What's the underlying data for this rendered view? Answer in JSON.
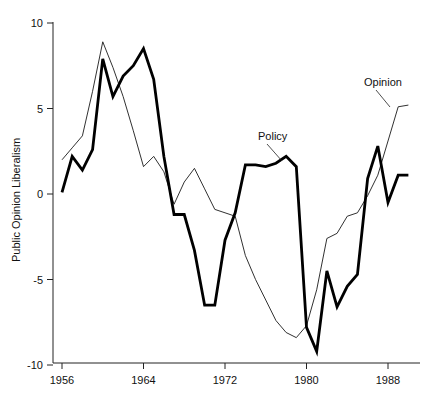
{
  "chart_data": {
    "type": "line",
    "title": "",
    "subtitle": "",
    "xlabel": "",
    "ylabel": "Public Opinion Liberalism",
    "xlim": [
      1955,
      1990.5
    ],
    "ylim": [
      -10.8,
      10.6
    ],
    "grid": false,
    "legend_position": "inline-annotation",
    "x_ticks": [
      1956,
      1964,
      1972,
      1980,
      1988
    ],
    "x_tick_labels": [
      "1956",
      "1964",
      "1972",
      "1980",
      "1988"
    ],
    "y_ticks": [
      10,
      5,
      0,
      -5,
      -10
    ],
    "y_tick_labels": [
      "10",
      "5",
      "0",
      "-5",
      "-10"
    ],
    "annotations": [
      {
        "text": "Policy",
        "x": 1977.0,
        "y": 6.1
      },
      {
        "text": "Opinion",
        "x": 1987.4,
        "y": 6.9
      }
    ],
    "series": [
      {
        "name": "Policy",
        "style": "thick-black",
        "x": [
          1956,
          1957,
          1958,
          1959,
          1960,
          1961,
          1962,
          1963,
          1964,
          1965,
          1966,
          1967,
          1968,
          1969,
          1970,
          1971,
          1972,
          1973,
          1974,
          1975,
          1976,
          1977,
          1978,
          1979,
          1980,
          1981,
          1982,
          1983,
          1984,
          1985,
          1986,
          1987,
          1988,
          1989,
          1990
        ],
        "values": [
          0.1,
          2.2,
          1.4,
          2.6,
          7.9,
          5.7,
          6.9,
          7.5,
          8.5,
          6.7,
          2.2,
          -1.2,
          -1.2,
          -3.3,
          -6.5,
          -6.5,
          -2.7,
          -1.1,
          1.7,
          1.7,
          1.6,
          1.8,
          2.2,
          1.6,
          -7.8,
          -9.2,
          -4.5,
          -6.6,
          -5.4,
          -4.7,
          0.9,
          2.8,
          -0.5,
          1.1,
          1.1
        ]
      },
      {
        "name": "Opinion",
        "style": "thin-black",
        "x": [
          1956,
          1957,
          1958,
          1959,
          1960,
          1961,
          1962,
          1963,
          1964,
          1965,
          1966,
          1967,
          1968,
          1969,
          1970,
          1971,
          1972,
          1973,
          1974,
          1975,
          1976,
          1977,
          1978,
          1979,
          1980,
          1981,
          1982,
          1983,
          1984,
          1985,
          1986,
          1987,
          1988,
          1989,
          1990
        ],
        "values": [
          2.0,
          2.7,
          3.4,
          6.0,
          8.9,
          7.4,
          5.7,
          3.7,
          1.6,
          2.2,
          1.3,
          -0.6,
          0.7,
          1.5,
          0.3,
          -0.9,
          -1.1,
          -1.3,
          -3.6,
          -5.0,
          -6.2,
          -7.4,
          -8.1,
          -8.4,
          -7.7,
          -5.6,
          -2.6,
          -2.3,
          -1.3,
          -1.1,
          -0.1,
          1.1,
          3.1,
          5.1,
          5.2
        ]
      }
    ]
  },
  "axis": {
    "y_title": "Public Opinion Liberalism"
  }
}
